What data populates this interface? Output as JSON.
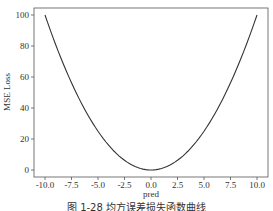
{
  "chart_data": {
    "type": "line",
    "title": "",
    "xlabel": "pred",
    "ylabel": "MSE Loss",
    "xlim": [
      -11.0,
      11.0
    ],
    "ylim": [
      -5,
      105
    ],
    "grid": false,
    "legend": null,
    "x_ticks": [
      -10.0,
      -7.5,
      -5.0,
      -2.5,
      0.0,
      2.5,
      5.0,
      7.5,
      10.0
    ],
    "x_tick_labels": [
      "-10.0",
      "-7.5",
      "-5.0",
      "-2.5",
      "0.0",
      "2.5",
      "5.0",
      "7.5",
      "10.0"
    ],
    "y_ticks": [
      0,
      20,
      40,
      60,
      80,
      100
    ],
    "y_tick_labels": [
      "0",
      "20",
      "40",
      "60",
      "80",
      "100"
    ],
    "series": [
      {
        "name": "MSE Loss",
        "color": "#333333",
        "function": "y = x^2",
        "x": [
          -10,
          -9,
          -8,
          -7,
          -6,
          -5,
          -4,
          -3,
          -2,
          -1,
          0,
          1,
          2,
          3,
          4,
          5,
          6,
          7,
          8,
          9,
          10
        ],
        "y": [
          100,
          81,
          64,
          49,
          36,
          25,
          16,
          9,
          4,
          1,
          0,
          1,
          4,
          9,
          16,
          25,
          36,
          49,
          64,
          81,
          100
        ]
      }
    ]
  },
  "caption": "图 1-28  均方误差损失函数曲线"
}
